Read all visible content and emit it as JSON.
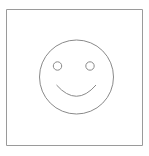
{
  "figure": {
    "canvas": {
      "width": 149,
      "height": 156,
      "background_color": "#ffffff"
    },
    "style": {
      "stroke_color": "#8a8a8a",
      "frame_stroke_color": "#9a9a9a",
      "frame_bottom_stroke_color": "#7d7d7d",
      "stroke_width": 1,
      "fill": "none"
    },
    "elements": {
      "frame": {
        "name": "outer-square-frame",
        "shape": "rectangle",
        "x": 6.5,
        "y": 9.5,
        "width": 136,
        "height": 136
      },
      "face": {
        "name": "face-outline",
        "shape": "circle",
        "cx": 76.5,
        "cy": 77,
        "r": 37
      },
      "left_eye": {
        "name": "left-eye",
        "shape": "circle",
        "cx": 57.5,
        "cy": 66,
        "r": 4.2
      },
      "right_eye": {
        "name": "right-eye",
        "shape": "circle",
        "cx": 90,
        "cy": 66,
        "r": 4.2
      },
      "mouth": {
        "name": "smile-mouth",
        "shape": "arc",
        "path": "M 56.5 85 Q 76.5 107.5 96 85",
        "start_x": 56.5,
        "start_y": 85,
        "end_x": 96,
        "end_y": 85,
        "control_x": 76.5,
        "control_y": 107.5
      }
    }
  }
}
